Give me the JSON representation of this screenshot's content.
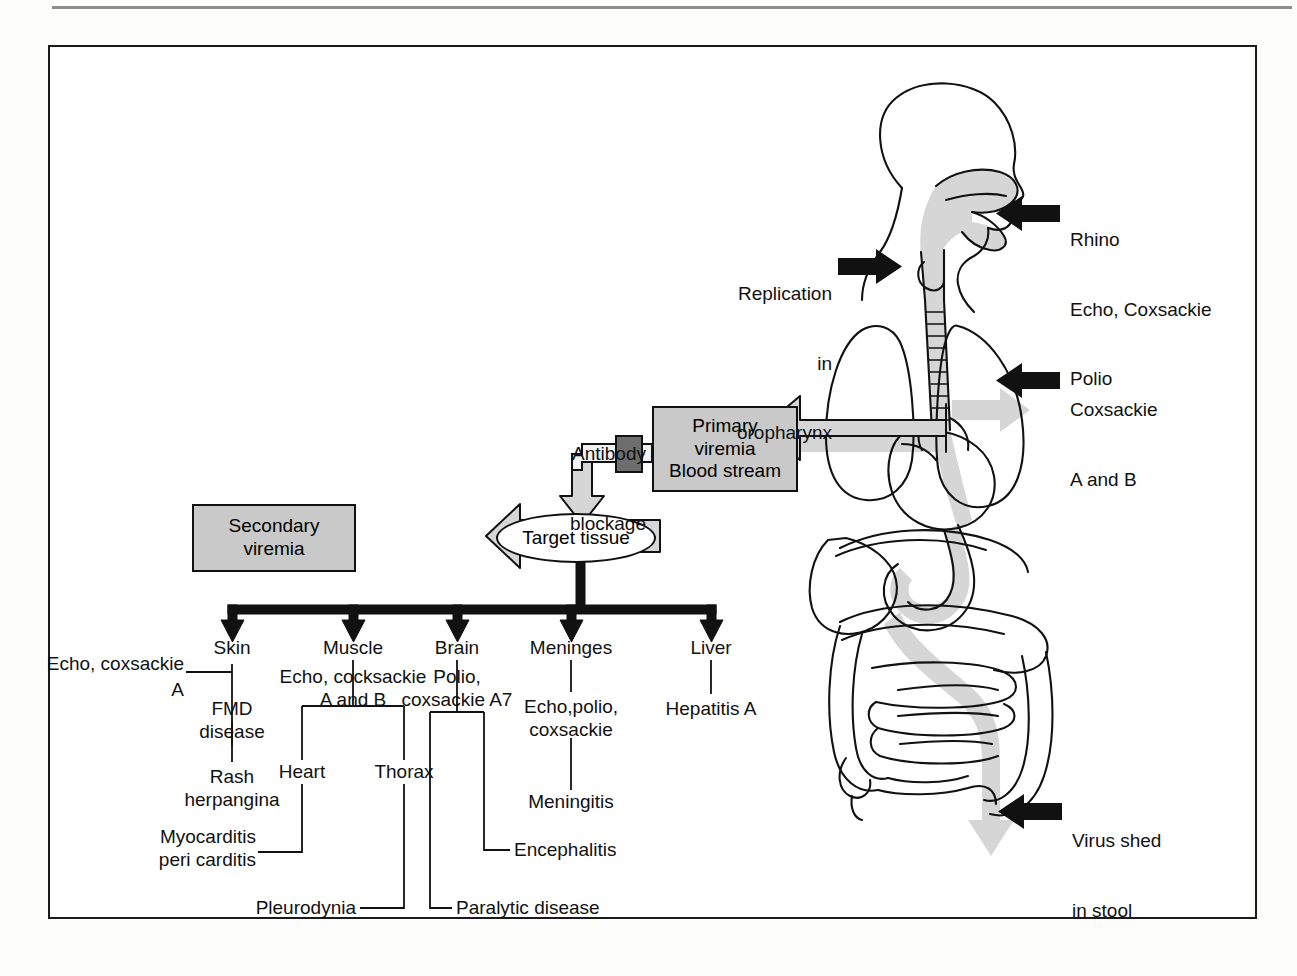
{
  "figure": {
    "type": "pathogenesis-flow-diagram"
  },
  "anatomy": {
    "alt": "sagittal human body outline showing head, pharynx, esophagus, lungs, heart, liver, stomach and intestines with shaded viral pathway",
    "shade_color": "#d4d4d4",
    "outline_color": "#111111"
  },
  "entry_labels": {
    "upper_respiratory": {
      "lines": [
        "Rhino",
        "Echo, Coxsackie",
        "Polio"
      ],
      "arrow": "black-left-arrow"
    },
    "lower_respiratory": {
      "lines": [
        "Coxsackie",
        "A and B"
      ],
      "arrow": "black-left-arrow"
    },
    "oropharynx": {
      "lines": [
        "Replication",
        "in",
        "oropharynx"
      ],
      "arrow": "black-right-arrow"
    },
    "stool": {
      "lines": [
        "Virus shed",
        "in stool"
      ],
      "arrow": "black-left-arrow"
    }
  },
  "flow": {
    "antibody_blockage": {
      "lines": [
        "Antibody",
        "blockage"
      ],
      "block_color": "#6e6e6e"
    },
    "primary_viremia": {
      "lines": [
        "Primary",
        "viremia",
        "Blood stream"
      ],
      "fill": "#c9c9c9"
    },
    "secondary_viremia": {
      "lines": [
        "Secondary",
        "viremia"
      ],
      "fill": "#c9c9c9"
    },
    "target_tissue": {
      "label": "Target tissue",
      "fill": "#ffffff"
    }
  },
  "branches": [
    {
      "organ": "Skin",
      "agents": [
        "Echo, coxsackie",
        "A"
      ],
      "chain": [
        "FMD\ndisease",
        "Rash\nherpangina"
      ]
    },
    {
      "organ": "Muscle",
      "agents": [
        "Echo, cocksackie",
        "A and B"
      ],
      "subnodes": [
        "Heart",
        "Thorax"
      ],
      "outcomes": [
        "Myocarditis\npericarditis",
        "Pleurodynia"
      ]
    },
    {
      "organ": "Brain",
      "agents": [
        "Polio,",
        "coxsackie A7"
      ],
      "outcomes": [
        "Encephalitis",
        "Paralytic disease"
      ]
    },
    {
      "organ": "Meninges",
      "agents": [
        "Echo,polio,",
        "coxsackie"
      ],
      "outcomes": [
        "Meningitis"
      ]
    },
    {
      "organ": "Liver",
      "agents": [],
      "outcomes": [
        "Hepatitis A"
      ]
    }
  ],
  "text": {
    "rhino": "Rhino",
    "echo_coxsackie": "Echo, Coxsackie",
    "polio": "Polio",
    "coxsackie": "Coxsackie",
    "a_and_b": "A and B",
    "replication": "Replication",
    "in": "in",
    "oropharynx": "oropharynx",
    "virus_shed": "Virus shed",
    "in_stool": "in stool",
    "antibody": "Antibody",
    "blockage": "blockage",
    "primary": "Primary",
    "viremia": "viremia",
    "blood_stream": "Blood stream",
    "secondary": "Secondary",
    "viremia2": "viremia",
    "target_tissue": "Target tissue",
    "skin": "Skin",
    "muscle": "Muscle",
    "brain": "Brain",
    "meninges": "Meninges",
    "liver": "Liver",
    "echo_coxsackie_lc": "Echo, coxsackie",
    "a_only": "A",
    "fmd": "FMD",
    "disease": "disease",
    "rash": "Rash",
    "herpangina": "herpangina",
    "echo_cocksackie": "Echo, cocksackie",
    "a_and_b_lc": "A and B",
    "heart": "Heart",
    "thorax": "Thorax",
    "myocarditis": "Myocarditis",
    "pericarditis": "peri carditis",
    "pleurodynia": "Pleurodynia",
    "polio_comma": "Polio,",
    "coxsackie_a7": "coxsackie A7",
    "encephalitis": "Encephalitis",
    "paralytic": "Paralytic disease",
    "echo_polio": "Echo,polio,",
    "coxsackie_lc": "coxsackie",
    "meningitis": "Meningitis",
    "hepatitis_a": "Hepatitis A"
  }
}
